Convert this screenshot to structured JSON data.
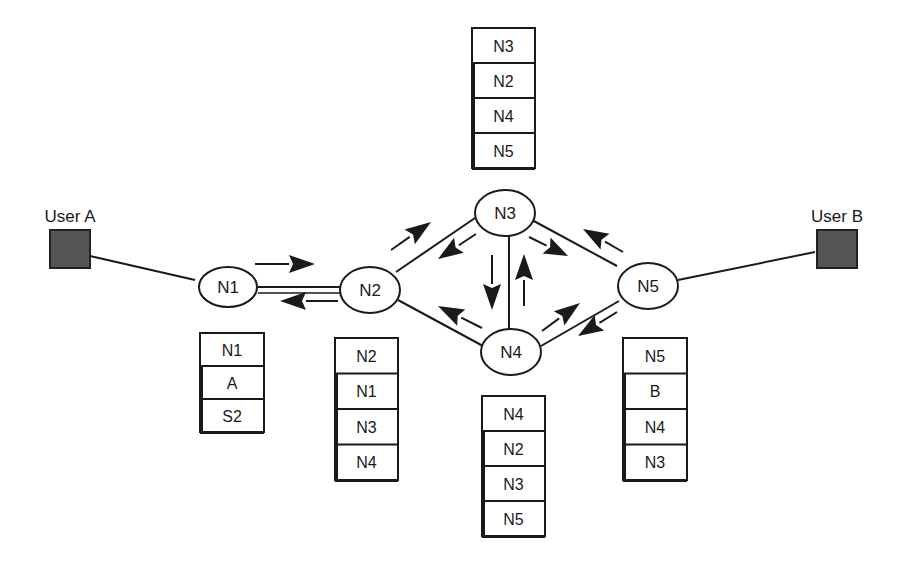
{
  "users": [
    {
      "id": "userA",
      "label": "User A",
      "x": 50,
      "y": 230,
      "w": 40,
      "h": 38,
      "labelX": 70,
      "labelY": 222,
      "fill": "#555555",
      "connect": "N1"
    },
    {
      "id": "userB",
      "label": "User B",
      "x": 817,
      "y": 230,
      "w": 40,
      "h": 38,
      "labelX": 837,
      "labelY": 222,
      "fill": "#555555",
      "connect": "N5"
    }
  ],
  "nodes": [
    {
      "id": "N1",
      "label": "N1",
      "cx": 228,
      "cy": 287,
      "rx": 29,
      "ry": 20
    },
    {
      "id": "N2",
      "label": "N2",
      "cx": 370,
      "cy": 290,
      "rx": 30,
      "ry": 23
    },
    {
      "id": "N3",
      "label": "N3",
      "cx": 505,
      "cy": 213,
      "rx": 30,
      "ry": 23
    },
    {
      "id": "N4",
      "label": "N4",
      "cx": 511,
      "cy": 352,
      "rx": 30,
      "ry": 23
    },
    {
      "id": "N5",
      "label": "N5",
      "cx": 648,
      "cy": 286,
      "rx": 30,
      "ry": 23
    }
  ],
  "links": [
    {
      "from": "userA",
      "x1": 90,
      "y1": 256,
      "x2": 195,
      "y2": 280
    },
    {
      "from": "N1",
      "to": "N2",
      "x1": 258,
      "y1": 287,
      "x2": 340,
      "y2": 287
    },
    {
      "from": "N2",
      "to": "N3",
      "x1": 396,
      "y1": 272,
      "x2": 475,
      "y2": 218
    },
    {
      "from": "N2",
      "to": "N4",
      "x1": 398,
      "y1": 300,
      "x2": 483,
      "y2": 346
    },
    {
      "from": "N3",
      "to": "N4",
      "x1": 509,
      "y1": 236,
      "x2": 509,
      "y2": 329
    },
    {
      "from": "N3",
      "to": "N5",
      "x1": 532,
      "y1": 220,
      "x2": 617,
      "y2": 266
    },
    {
      "from": "N4",
      "to": "N5",
      "x1": 541,
      "y1": 346,
      "x2": 619,
      "y2": 301
    },
    {
      "from": "N5",
      "to": "userB",
      "x1": 678,
      "y1": 280,
      "x2": 815,
      "y2": 252
    }
  ],
  "arrows": [
    {
      "id": "n1-to-n2",
      "x1": 255,
      "y1": 264,
      "x2": 315,
      "y2": 264
    },
    {
      "id": "n2-to-n1",
      "x1": 338,
      "y1": 301,
      "x2": 280,
      "y2": 301
    },
    {
      "id": "n2-to-n3",
      "x1": 391,
      "y1": 250,
      "x2": 431,
      "y2": 222
    },
    {
      "id": "n3-to-n2",
      "x1": 476,
      "y1": 234,
      "x2": 438,
      "y2": 259
    },
    {
      "id": "n4-to-n2",
      "x1": 482,
      "y1": 328,
      "x2": 438,
      "y2": 306
    },
    {
      "id": "n3-to-n4",
      "x1": 492,
      "y1": 255,
      "x2": 492,
      "y2": 310
    },
    {
      "id": "n4-to-n3",
      "x1": 524,
      "y1": 306,
      "x2": 524,
      "y2": 254
    },
    {
      "id": "n3-to-n5",
      "x1": 529,
      "y1": 237,
      "x2": 568,
      "y2": 256
    },
    {
      "id": "n4-to-n5",
      "x1": 542,
      "y1": 331,
      "x2": 580,
      "y2": 303
    },
    {
      "id": "n5-to-n3",
      "x1": 623,
      "y1": 252,
      "x2": 583,
      "y2": 229
    },
    {
      "id": "n5-to-n4",
      "x1": 617,
      "y1": 312,
      "x2": 578,
      "y2": 336
    }
  ],
  "stacks": [
    {
      "id": "stack-n1",
      "x": 200,
      "y": 333,
      "w": 64,
      "cellH": 33,
      "cells": [
        "N1",
        "A",
        "S2"
      ]
    },
    {
      "id": "stack-n2",
      "x": 335,
      "y": 338,
      "w": 63,
      "cellH": 35.5,
      "cells": [
        "N2",
        "N1",
        "N3",
        "N4"
      ]
    },
    {
      "id": "stack-n3",
      "x": 472,
      "y": 28,
      "w": 63,
      "cellH": 35,
      "cells": [
        "N3",
        "N2",
        "N4",
        "N5"
      ]
    },
    {
      "id": "stack-n4",
      "x": 482,
      "y": 396,
      "w": 63,
      "cellH": 35,
      "cells": [
        "N4",
        "N2",
        "N3",
        "N5"
      ]
    },
    {
      "id": "stack-n5",
      "x": 623,
      "y": 338,
      "w": 64,
      "cellH": 35.5,
      "cells": [
        "N5",
        "B",
        "N4",
        "N3"
      ]
    }
  ],
  "colors": {
    "stroke": "#1a1a1a",
    "text": "#1a1a1a",
    "userFill": "#555555",
    "background": "#ffffff"
  }
}
